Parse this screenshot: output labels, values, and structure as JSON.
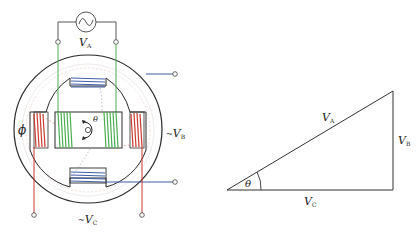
{
  "figure": {
    "left_panel": {
      "title": "Synchro / resolver schematic",
      "source_symbol": "ac-source-icon",
      "labels": {
        "va": "V",
        "va_sub": "A",
        "vb": "V",
        "vb_sub": "B",
        "vc": "V",
        "vc_sub": "C",
        "phi": "ϕ",
        "theta": "θ",
        "vb_prefix": "~",
        "vc_prefix": "~"
      },
      "colors": {
        "stator_outline": "#2b2b2b",
        "rotor_coil": "#4caf50",
        "blue_coil": "#3f5fa8",
        "red_coil": "#cc3b2e",
        "field_lines": "#d9a08a"
      }
    },
    "right_panel": {
      "title": "Voltage triangle",
      "labels": {
        "hypotenuse": "V",
        "hypotenuse_sub": "A",
        "vertical": "V",
        "vertical_sub": "B",
        "horizontal": "V",
        "horizontal_sub": "C",
        "angle": "θ"
      }
    }
  }
}
